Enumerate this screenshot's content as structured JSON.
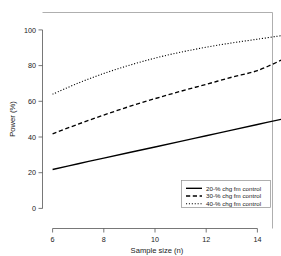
{
  "chart_data": {
    "type": "line",
    "title": "",
    "subtitle": "",
    "xlabel": "Sample size (n)",
    "ylabel": "Power (%)",
    "xlim": [
      5.5,
      15.4
    ],
    "ylim": [
      0,
      104
    ],
    "xticks": [
      6,
      8,
      10,
      12,
      14
    ],
    "yticks": [
      0,
      20,
      40,
      60,
      80,
      100
    ],
    "xtick_labels": [
      "6",
      "8",
      "10",
      "12",
      "14"
    ],
    "ytick_labels": [
      "0",
      "20",
      "40",
      "60",
      "80",
      "100"
    ],
    "grid": false,
    "legend_position": "bottom-right",
    "x": [
      6,
      7,
      8,
      9,
      10,
      11,
      12,
      13,
      14,
      15
    ],
    "series": [
      {
        "name": "20-% chg fm control",
        "style": "solid",
        "color": "#000000",
        "values": [
          21.8,
          25.0,
          28.2,
          31.3,
          34.4,
          37.5,
          40.7,
          43.9,
          47.0,
          50.1
        ]
      },
      {
        "name": "30-% chg fm control",
        "style": "dashed",
        "color": "#000000",
        "values": [
          41.8,
          47.2,
          52.3,
          57.1,
          61.5,
          65.6,
          69.5,
          73.5,
          77.2,
          83.5
        ]
      },
      {
        "name": "40-% chg fm control",
        "style": "dotted",
        "color": "#000000",
        "values": [
          64.0,
          70.2,
          75.6,
          80.2,
          84.2,
          87.5,
          90.3,
          92.7,
          94.8,
          96.9
        ]
      }
    ]
  },
  "legend": {
    "entries": [
      {
        "label": "20-% chg fm control",
        "style": "solid"
      },
      {
        "label": "30-% chg fm control",
        "style": "dashed"
      },
      {
        "label": "40-% chg fm control",
        "style": "dotted"
      }
    ]
  },
  "axes": {
    "x_title": "Sample size (n)",
    "y_title": "Power (%)"
  },
  "colors": {
    "series": "#000000",
    "axis": "#555555",
    "frame": "#9a9a9a",
    "background": "#ffffff",
    "text": "#1a1a1a"
  }
}
